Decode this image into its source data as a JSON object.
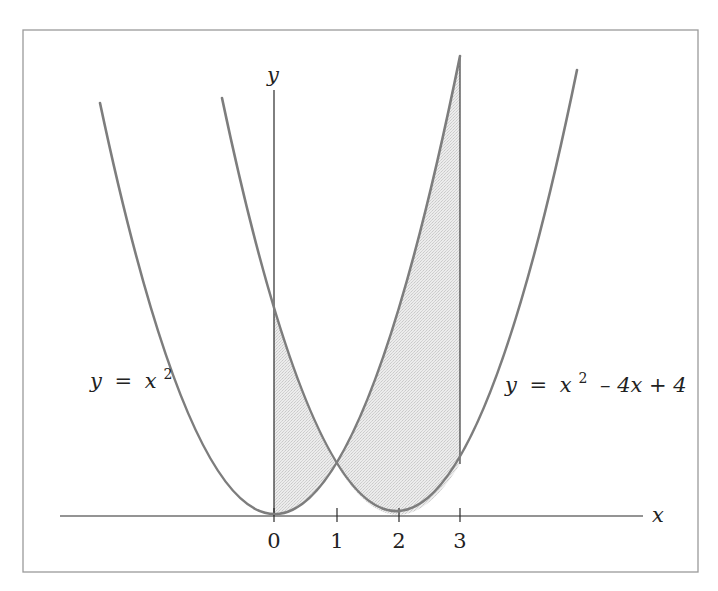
{
  "figure": {
    "type": "function-graph",
    "axes": {
      "x_label": "x",
      "y_label": "y",
      "x_ticks": [
        "0",
        "1",
        "2",
        "3"
      ]
    },
    "curves": [
      {
        "id": "parabola",
        "equation": "y = x^2",
        "label_parts": {
          "lhs": "y",
          "eq": "=",
          "base": "x",
          "exp": "2",
          "rest": ""
        }
      },
      {
        "id": "shifted-parabola",
        "equation": "y = x^2 - 4x + 4",
        "label_parts": {
          "lhs": "y",
          "eq": "=",
          "base": "x",
          "exp": "2",
          "rest": "– 4x + 4"
        }
      }
    ],
    "shaded_region": {
      "description": "Area between y = x^2 and y = x^2 - 4x + 4 from x = 0 to x = 3",
      "x_from": 0,
      "x_to": 3,
      "intersection": {
        "x": 1,
        "y": 1
      }
    },
    "colors": {
      "curve": "#7d7d7d",
      "axis": "#2a2a2a",
      "fill": "#e3e3e3",
      "frame": "#9a9a9a"
    }
  }
}
